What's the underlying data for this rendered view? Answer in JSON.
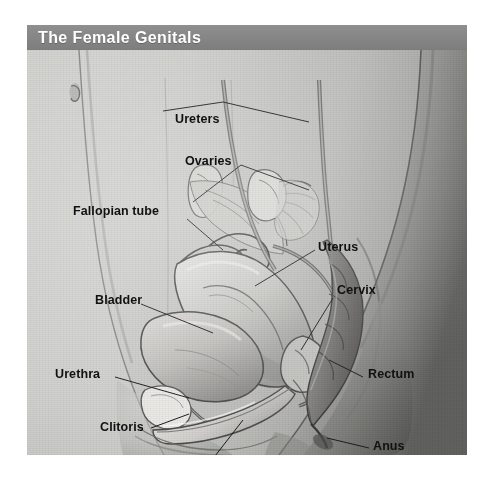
{
  "header": {
    "title": "The Female Genitals",
    "bar_color": "#858585",
    "title_color": "#ffffff"
  },
  "illustration": {
    "kind": "anatomical-illustration",
    "subject": "Female pelvis, mid-sagittal section",
    "style": "grayscale pencil rendering",
    "background_color": "#c9c9c7",
    "label_color": "#111111",
    "leader_line_color": "#1a1a1a"
  },
  "labels": [
    {
      "id": "ureters",
      "text": "Ureters"
    },
    {
      "id": "ovaries",
      "text": "Ovaries"
    },
    {
      "id": "fallopian-tube",
      "text": "Fallopian tube"
    },
    {
      "id": "uterus",
      "text": "Uterus"
    },
    {
      "id": "cervix",
      "text": "Cervix"
    },
    {
      "id": "bladder",
      "text": "Bladder"
    },
    {
      "id": "urethra",
      "text": "Urethra"
    },
    {
      "id": "rectum",
      "text": "Rectum"
    },
    {
      "id": "clitoris",
      "text": "Clitoris"
    },
    {
      "id": "vagina",
      "text": "Vagina"
    },
    {
      "id": "anus",
      "text": "Anus"
    }
  ]
}
